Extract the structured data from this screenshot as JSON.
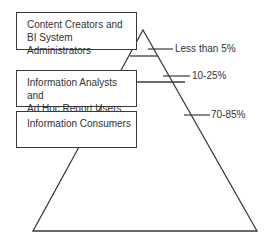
{
  "diagram": {
    "type": "pyramid",
    "tiers": [
      {
        "line1": "Content Creators and",
        "line2": "BI System Administrators",
        "share": "Less than 5%"
      },
      {
        "line1": "Information Analysts and",
        "line2": "Ad Hoc Report Users",
        "share": "10-25%"
      },
      {
        "line1": "Information Consumers",
        "line2": "",
        "share": "70-85%"
      }
    ],
    "colors": {
      "stroke": "#3a3a3a",
      "text": "#333333",
      "background": "#ffffff"
    }
  }
}
